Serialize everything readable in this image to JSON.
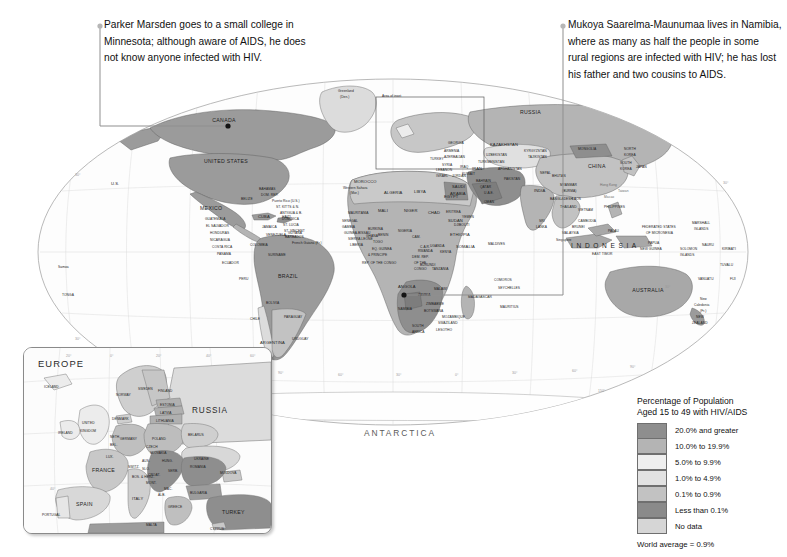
{
  "figure": {
    "type": "choropleth-world-map",
    "projection": "oval / Robinson-like interrupted",
    "background_color": "#ffffff"
  },
  "callouts": [
    {
      "id": "left",
      "text": "Parker Marsden goes to a small college in Minnesota; although aware of AIDS, he does not know anyone infected with HIV.",
      "anchor_label": "Minnesota, United States"
    },
    {
      "id": "right",
      "text": "Mukoya Saarelma-Maunumaa lives in Namibia, where as many as half the people in some rural regions are infected with HIV; he has lost his father and two cousins to AIDS.",
      "anchor_label": "Namibia"
    }
  ],
  "legend": {
    "title_line1": "Percentage of Population",
    "title_line2": "Aged 15 to 49 with HIV/AIDS",
    "items": [
      {
        "label": "20.0% and greater",
        "color": "#8e8e8e"
      },
      {
        "label": "10.0% to 19.9%",
        "color": "#b4b4b4"
      },
      {
        "label": "5.0% to 9.9%",
        "color": "#efefef"
      },
      {
        "label": "1.0% to 4.9%",
        "color": "#e2e2e2"
      },
      {
        "label": "0.1% to 0.9%",
        "color": "#c2c2c2"
      },
      {
        "label": "Less than 0.1%",
        "color": "#8a8a8a"
      },
      {
        "label": "No data",
        "color": "#d6d6d6"
      }
    ],
    "footnote": "World average = 0.9%"
  },
  "inset": {
    "title": "EUROPE",
    "secondary_label": "RUSSIA",
    "area_of_inset_label": "Area of inset",
    "countries": [
      "ICELAND",
      "NORWAY",
      "SWEDEN",
      "FINLAND",
      "ESTONIA",
      "LATVIA",
      "LITHUANIA",
      "DENMARK",
      "UNITED KINGDOM",
      "IRELAND",
      "NETH.",
      "BEL.",
      "GERMANY",
      "POLAND",
      "BELARUS",
      "UKRAINE",
      "MOLDOVA",
      "LUX.",
      "CZECH REP.",
      "SLOVAKIA",
      "AUS.",
      "HUNG.",
      "SWITZ.",
      "SLOVENIA",
      "CROATIA",
      "BOS. & HER.",
      "SERBIA",
      "MONT.",
      "MAC.",
      "ALB.",
      "ROMANIA",
      "BULGARIA",
      "GREECE",
      "ITALY",
      "FRANCE",
      "SPAIN",
      "PORTUGAL",
      "TURKEY",
      "MALTA",
      "CYPRUS"
    ],
    "grid_labels": [
      "20°",
      "0°",
      "20°",
      "40°",
      "60°",
      "60°",
      "40°",
      "30°"
    ]
  },
  "map": {
    "continent_labels": [
      "ANTARCTICA",
      "INDONESIA"
    ],
    "grid_labels_bottom": [
      "180°",
      "150°",
      "120°",
      "90°",
      "60°",
      "30°",
      "0°",
      "30°",
      "60°",
      "90°",
      "120°",
      "150°",
      "180°"
    ],
    "grid_labels_lat": [
      "60°",
      "30°",
      "0°",
      "30°",
      "60°"
    ],
    "annotations": [
      {
        "text": "Greenland (Den.)"
      },
      {
        "text": "Area of inset"
      },
      {
        "text": "Western Sahara (Mor.)"
      },
      {
        "text": "French Guiana (Fr.)"
      },
      {
        "text": "Puerto Rico (U.S.)"
      },
      {
        "text": "New Caledonia (Fr.)"
      },
      {
        "text": "Hong Kong"
      },
      {
        "text": "Macao"
      },
      {
        "text": "Taiwan"
      }
    ],
    "countries": [
      "CANADA",
      "UNITED STATES",
      "U.S.",
      "MEXICO",
      "BELIZE",
      "GUATEMALA",
      "EL SALVADOR",
      "HONDURAS",
      "NICARAGUA",
      "COSTA RICA",
      "PANAMA",
      "CUBA",
      "BAHAMAS",
      "JAMAICA",
      "HAITI",
      "DOM. REP.",
      "ST. KITTS & NEVIS",
      "ANTIGUA & BARB.",
      "DOMINICA",
      "ST. LUCIA",
      "ST. VINCENT & THE GRENADINES",
      "BARBADOS",
      "GRENADA",
      "TRINIDAD & TOBAGO",
      "COLOMBIA",
      "VENEZUELA",
      "GUYANA",
      "SURINAME",
      "ECUADOR",
      "PERU",
      "BRAZIL",
      "BOLIVIA",
      "PARAGUAY",
      "CHILE",
      "ARGENTINA",
      "URUGUAY",
      "MOROCCO",
      "ALGERIA",
      "TUNISIA",
      "LIBYA",
      "EGYPT",
      "MAURITANIA",
      "MALI",
      "NIGER",
      "CHAD",
      "SUDAN",
      "ERITREA",
      "DJIBOUTI",
      "ETHIOPIA",
      "SOMALIA",
      "KENYA",
      "UGANDA",
      "RWANDA",
      "BURUNDI",
      "TANZANIA",
      "DEM. REP. OF THE CONGO",
      "REP. OF THE CONGO",
      "GABON",
      "EQ. GUINEA",
      "CAMEROON",
      "CENTRAL AFRICAN REPUBLIC",
      "NIGERIA",
      "BENIN",
      "TOGO",
      "GHANA",
      "BURKINA FASO",
      "COTE D'IVOIRE",
      "LIBERIA",
      "SIERRA LEONE",
      "GUINEA",
      "GUINEA-BISSAU",
      "SENEGAL",
      "GAMBIA",
      "SAO TOME & PRINCIPE",
      "ANGOLA",
      "ZAMBIA",
      "MALAWI",
      "MOZAMBIQUE",
      "ZIMBABWE",
      "BOTSWANA",
      "NAMIBIA",
      "SOUTH AFRICA",
      "SWAZILAND",
      "LESOTHO",
      "MADAGASCAR",
      "COMOROS",
      "SEYCHELLES",
      "MAURITIUS",
      "MALDIVES",
      "RUSSIA",
      "KAZAKHSTAN",
      "UZBEKISTAN",
      "TURKMENISTAN",
      "KYRGYZSTAN",
      "TAJIKISTAN",
      "GEORGIA",
      "ARMENIA",
      "AZERBAIJAN",
      "TURKEY",
      "SYRIA",
      "LEBANON",
      "ISRAEL",
      "JORDAN",
      "IRAQ",
      "IRAN",
      "KUWAIT",
      "SAUDI ARABIA",
      "BAHRAIN",
      "QATAR",
      "U.A.E.",
      "OMAN",
      "YEMEN",
      "AFGHANISTAN",
      "PAKISTAN",
      "INDIA",
      "NEPAL",
      "BHUTAN",
      "BANGLADESH",
      "MYANMAR (BURMA)",
      "SRI LANKA",
      "THAILAND",
      "LAOS",
      "VIETNAM",
      "CAMBODIA",
      "MALAYSIA",
      "SINGAPORE",
      "BRUNEI",
      "INDONESIA",
      "EAST TIMOR",
      "PHILIPPINES",
      "CHINA",
      "MONGOLIA",
      "NORTH KOREA",
      "SOUTH KOREA",
      "JAPAN",
      "PALAU",
      "FEDERATED STATES OF MICRONESIA",
      "MARSHALL ISLANDS",
      "NAURU",
      "KIRIBATI",
      "TUVALU",
      "SOLOMON ISLANDS",
      "PAPUA NEW GUINEA",
      "VANUATU",
      "FIJI",
      "SAMOA",
      "TONGA",
      "AUSTRALIA",
      "NEW ZEALAND"
    ]
  }
}
